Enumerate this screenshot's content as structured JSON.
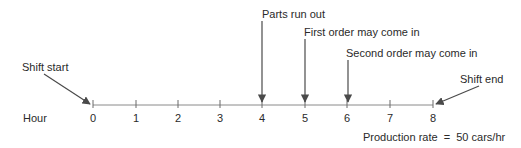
{
  "axis": {
    "label": "Hour",
    "ticks": [
      "0",
      "1",
      "2",
      "3",
      "4",
      "5",
      "6",
      "7",
      "8"
    ],
    "tick_x": [
      93,
      136,
      178,
      220,
      262,
      305,
      347,
      390,
      433
    ],
    "axis_y": 105,
    "line_color": "#8a8a8a"
  },
  "events": [
    {
      "label": "Shift start",
      "hour": 0
    },
    {
      "label": "Parts run out",
      "hour": 4
    },
    {
      "label": "First order may come in",
      "hour": 5
    },
    {
      "label": "Second order may come in",
      "hour": 6
    },
    {
      "label": "Shift end",
      "hour": 8
    }
  ],
  "footnote": "Production rate  =  50 cars/hr",
  "arrow_color": "#4a4a4a"
}
